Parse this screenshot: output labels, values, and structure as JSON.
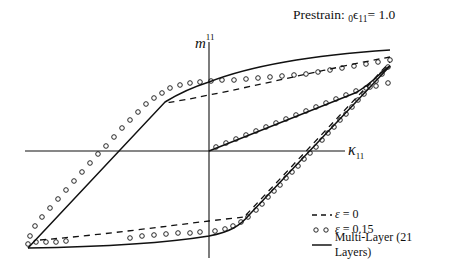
{
  "chart_data": {
    "type": "line",
    "title_parts": {
      "prefix": "Prestrain: ",
      "subscript_pre": "0",
      "symbol": "ϵ",
      "subscript": "11",
      "suffix": "= 1.0"
    },
    "xlabel": "κ₁₁",
    "xlabel_parts": {
      "symbol": "κ",
      "subscript": "11"
    },
    "ylabel": "m¹¹",
    "ylabel_parts": {
      "symbol": "m",
      "superscript": "11"
    },
    "grid": false,
    "axes": "centered-cross",
    "legend_position": "lower right",
    "legend": [
      {
        "label_symbol": "ε",
        "label_rest": " = 0",
        "label": "ε = 0",
        "style": "dashed"
      },
      {
        "label_symbol": "ε",
        "label_rest": " = 0.15",
        "label": "ε = 0.15",
        "style": "circles"
      },
      {
        "label_symbol": "",
        "label_rest": "Multi-Layer (21 Layers)",
        "label": "Multi-Layer (21 Layers)",
        "style": "solid"
      }
    ],
    "note": "Hysteresis loops of moment m11 vs curvature κ11 (no numeric ticks shown; pixel-space coordinates)",
    "axes_px": {
      "origin": [
        209,
        151
      ],
      "x_axis": [
        25,
        345
      ],
      "y_axis": [
        42,
        258
      ]
    },
    "series": [
      {
        "name": "Multi-Layer (21 Layers)",
        "style": "solid",
        "paths": [
          "M390,50 C330,54 260,62 209,82 C190,88 178,94 165,102 L28,248",
          "M28,248 C90,247 160,244 209,236 C230,232 240,226 250,214 L390,66",
          "M209,151 L355,93 C370,86 380,72 390,66"
        ]
      },
      {
        "name": "ε = 0",
        "style": "dashed",
        "paths": [
          "M390,57 C330,68 260,85 209,95 C190,99 178,101 165,103",
          "M40,240 C100,235 160,227 209,221 C225,219 235,218 245,217",
          "M246,215 L390,62"
        ]
      },
      {
        "name": "ε = 0.15",
        "style": "circles",
        "points": [
          [
            390,
            60
          ],
          [
            378,
            62
          ],
          [
            366,
            64
          ],
          [
            354,
            66
          ],
          [
            342,
            68
          ],
          [
            330,
            70
          ],
          [
            318,
            72
          ],
          [
            306,
            74
          ],
          [
            294,
            75
          ],
          [
            282,
            76
          ],
          [
            270,
            77
          ],
          [
            258,
            78
          ],
          [
            246,
            79
          ],
          [
            234,
            80
          ],
          [
            222,
            80
          ],
          [
            211,
            81
          ],
          [
            200,
            82
          ],
          [
            190,
            83
          ],
          [
            180,
            85
          ],
          [
            170,
            88
          ],
          [
            162,
            93
          ],
          [
            154,
            98
          ],
          [
            146,
            104
          ],
          [
            138,
            112
          ],
          [
            130,
            120
          ],
          [
            122,
            128
          ],
          [
            114,
            137
          ],
          [
            106,
            146
          ],
          [
            98,
            154
          ],
          [
            90,
            163
          ],
          [
            82,
            172
          ],
          [
            74,
            181
          ],
          [
            66,
            190
          ],
          [
            58,
            199
          ],
          [
            50,
            208
          ],
          [
            42,
            217
          ],
          [
            35,
            226
          ],
          [
            30,
            236
          ],
          [
            28,
            244
          ],
          [
            36,
            242
          ],
          [
            46,
            242
          ],
          [
            56,
            242
          ],
          [
            66,
            241
          ],
          [
            130,
            238
          ],
          [
            142,
            236
          ],
          [
            154,
            235
          ],
          [
            166,
            234
          ],
          [
            178,
            233
          ],
          [
            190,
            233
          ],
          [
            200,
            232
          ],
          [
            215,
            231
          ],
          [
            225,
            229
          ],
          [
            233,
            226
          ],
          [
            241,
            222
          ],
          [
            248,
            217
          ],
          [
            256,
            210
          ],
          [
            262,
            204
          ],
          [
            268,
            197
          ],
          [
            274,
            191
          ],
          [
            280,
            185
          ],
          [
            286,
            178
          ],
          [
            292,
            172
          ],
          [
            298,
            166
          ],
          [
            304,
            159
          ],
          [
            310,
            153
          ],
          [
            316,
            147
          ],
          [
            322,
            140
          ],
          [
            328,
            133
          ],
          [
            334,
            127
          ],
          [
            340,
            120
          ],
          [
            346,
            114
          ],
          [
            352,
            107
          ],
          [
            358,
            100
          ],
          [
            364,
            94
          ],
          [
            370,
            87
          ],
          [
            376,
            81
          ],
          [
            382,
            74
          ],
          [
            388,
            67
          ],
          [
            216,
            147
          ],
          [
            226,
            143
          ],
          [
            236,
            139
          ],
          [
            246,
            135
          ],
          [
            256,
            131
          ],
          [
            266,
            127
          ],
          [
            276,
            123
          ],
          [
            286,
            119
          ],
          [
            296,
            115
          ],
          [
            306,
            111
          ],
          [
            316,
            107
          ],
          [
            326,
            103
          ],
          [
            336,
            99
          ],
          [
            346,
            95
          ],
          [
            356,
            91
          ],
          [
            366,
            88
          ],
          [
            376,
            86
          ],
          [
            388,
            83
          ]
        ]
      }
    ]
  }
}
